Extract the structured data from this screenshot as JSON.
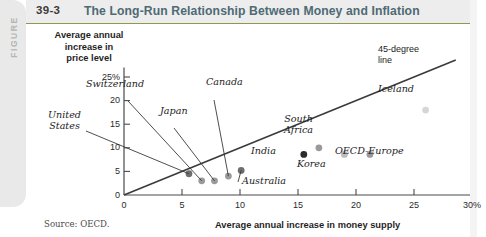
{
  "figure": {
    "tab_label": "FIGURE",
    "number": "39-3",
    "title": "The Long-Run Relationship Between Money and Inflation",
    "source": "Source: OECD.",
    "accent_color": "#8e9a4a",
    "title_color": "#4e6a74"
  },
  "chart_data": {
    "type": "scatter",
    "title": "The Long-Run Relationship Between Money and Inflation",
    "xlabel": "Average annual increase in money supply",
    "ylabel": "Average annual increase in price level",
    "xlim": [
      0,
      30
    ],
    "ylim": [
      0,
      27
    ],
    "xticks": [
      "0",
      "5",
      "10",
      "15",
      "20",
      "25",
      "30%"
    ],
    "xtick_values": [
      0,
      5,
      10,
      15,
      20,
      25,
      30
    ],
    "yticks": [
      "0",
      "5",
      "10",
      "15",
      "20",
      "25%"
    ],
    "ytick_values": [
      0,
      5,
      10,
      15,
      20,
      25
    ],
    "grid": false,
    "legend": false,
    "reference_line": {
      "name": "45-degree line",
      "label": "45-degree\nline",
      "label_line1": "45-degree",
      "label_line2": "line",
      "slope": 1,
      "intercept": 0,
      "color": "#3a3a3a"
    },
    "points": [
      {
        "name": "United States",
        "x": 5.6,
        "y": 4.5,
        "color": "#6e6e6e",
        "label_pos": "upper-left"
      },
      {
        "name": "Switzerland",
        "x": 6.7,
        "y": 3.0,
        "color": "#9a9a9a",
        "label_pos": "upper-left"
      },
      {
        "name": "Japan",
        "x": 7.8,
        "y": 3.0,
        "color": "#9a9a9a",
        "label_pos": "upper-left"
      },
      {
        "name": "Canada",
        "x": 9.0,
        "y": 4.0,
        "color": "#9a9a9a",
        "label_pos": "upper"
      },
      {
        "name": "Australia",
        "x": 10.1,
        "y": 5.2,
        "color": "#6e6e6e",
        "label_pos": "lower-right"
      },
      {
        "name": "India",
        "x": 15.5,
        "y": 8.6,
        "color": "#2b2b2b",
        "label_pos": "left"
      },
      {
        "name": "South Africa",
        "x": 16.8,
        "y": 10.0,
        "color": "#9a9a9a",
        "label_pos": "upper-right"
      },
      {
        "name": "Korea",
        "x": 19.0,
        "y": 8.6,
        "color": "#bdbdbd",
        "label_pos": "lower"
      },
      {
        "name": "OECD-Europe",
        "x": 21.2,
        "y": 8.6,
        "color": "#9a9a9a",
        "label_pos": "right"
      },
      {
        "name": "Iceland",
        "x": 26.0,
        "y": 18.0,
        "color": "#d6d6d6",
        "label_pos": "upper"
      }
    ]
  }
}
